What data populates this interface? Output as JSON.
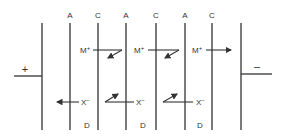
{
  "diagram": {
    "electrodes": {
      "anode": {
        "label": "+"
      },
      "cathode": {
        "label": "–"
      }
    },
    "membranes": [
      {
        "label": "A"
      },
      {
        "label": "C"
      },
      {
        "label": "A"
      },
      {
        "label": "C"
      },
      {
        "label": "A"
      },
      {
        "label": "C"
      }
    ],
    "compartment_labels": [
      {
        "label": "D"
      },
      {
        "label": "D"
      },
      {
        "label": "D"
      }
    ],
    "cation": {
      "symbol": "M",
      "charge": "+"
    },
    "anion": {
      "symbol": "X",
      "charge": "−"
    },
    "stroke_color": "#333333"
  }
}
